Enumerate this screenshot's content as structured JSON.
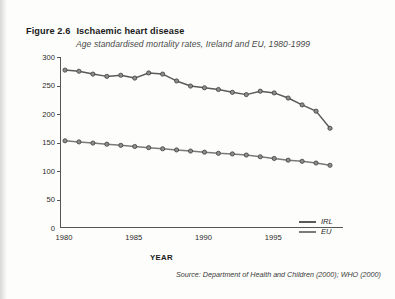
{
  "figure": {
    "number": "Figure 2.6",
    "title": "Ischaemic heart disease",
    "subtitle": "Age standardised mortality rates, Ireland and EU, 1980-1999",
    "source": "Source: Department of Health and Children (2000); WHO (2000)"
  },
  "axes": {
    "y_label": "Mortality rate per 100,000",
    "x_label": "YEAR",
    "y_ticks": [
      "0",
      "50",
      "100",
      "150",
      "200",
      "250",
      "300"
    ],
    "x_ticks": [
      "1980",
      "1985",
      "1990",
      "1995"
    ]
  },
  "legend": {
    "items": [
      {
        "label": "IRL",
        "color": "#5a5a5a"
      },
      {
        "label": "EU",
        "color": "#7a7a7a"
      }
    ]
  },
  "chart_data": {
    "type": "line",
    "title": "Ischaemic heart disease",
    "subtitle": "Age standardised mortality rates, Ireland and EU, 1980-1999",
    "xlabel": "YEAR",
    "ylabel": "Mortality rate per 100,000",
    "xlim": [
      1980,
      1999
    ],
    "ylim": [
      0,
      300
    ],
    "ytick_step": 50,
    "xtick_values": [
      1980,
      1985,
      1990,
      1995
    ],
    "grid": false,
    "legend_position": "bottom-right",
    "x": [
      1980,
      1981,
      1982,
      1983,
      1984,
      1985,
      1986,
      1987,
      1988,
      1989,
      1990,
      1991,
      1992,
      1993,
      1994,
      1995,
      1996,
      1997,
      1998,
      1999
    ],
    "series": [
      {
        "name": "IRL",
        "color": "#5a5a5a",
        "marker": "circle",
        "values": [
          277,
          275,
          270,
          266,
          268,
          263,
          272,
          270,
          258,
          249,
          246,
          243,
          238,
          234,
          240,
          237,
          228,
          216,
          205,
          175
        ]
      },
      {
        "name": "EU",
        "color": "#7a7a7a",
        "marker": "circle",
        "values": [
          153,
          151,
          149,
          147,
          145,
          143,
          141,
          139,
          137,
          135,
          133,
          131,
          130,
          128,
          125,
          122,
          119,
          117,
          114,
          110
        ]
      }
    ]
  }
}
